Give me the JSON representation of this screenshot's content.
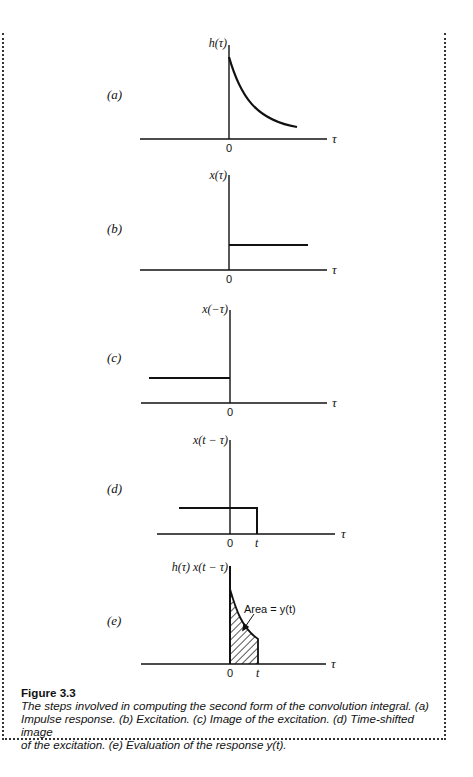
{
  "figure": {
    "title": "Figure 3.3",
    "caption": "The steps involved in computing the second form of the convolution integral. (a) Impulse response. (b) Excitation. (c) Image of the excitation. (d) Time-shifted image of the excitation. (e) Evaluation of the response y(t).",
    "caption_lines": [
      "The steps involved in computing the second form of the convolution integral. (a)",
      "Impulse response. (b) Excitation. (c) Image of the excitation. (d) Time-shifted image",
      "of the excitation. (e) Evaluation of the response y(t)."
    ]
  },
  "panels": [
    {
      "id": "a",
      "label": "(a)",
      "ylabel": "h(τ)",
      "xlabel": "τ",
      "origin_tick": "0",
      "description": "Impulse response: decaying exponential starting at τ=0"
    },
    {
      "id": "b",
      "label": "(b)",
      "ylabel": "x(τ)",
      "xlabel": "τ",
      "origin_tick": "0",
      "description": "Excitation: unit step starting at τ=0"
    },
    {
      "id": "c",
      "label": "(c)",
      "ylabel": "x(−τ)",
      "xlabel": "τ",
      "origin_tick": "0",
      "description": "Image of the excitation: step for τ<0"
    },
    {
      "id": "d",
      "label": "(d)",
      "ylabel": "x(t − τ)",
      "xlabel": "τ",
      "origin_tick": "0",
      "t_tick": "t",
      "description": "Time-shifted image: step for τ<t"
    },
    {
      "id": "e",
      "label": "(e)",
      "ylabel": "h(τ) x(t − τ)",
      "xlabel": "τ",
      "origin_tick": "0",
      "t_tick": "t",
      "annotation": "Area = y(t)",
      "description": "Product; shaded area from 0 to t equals y(t)"
    }
  ]
}
